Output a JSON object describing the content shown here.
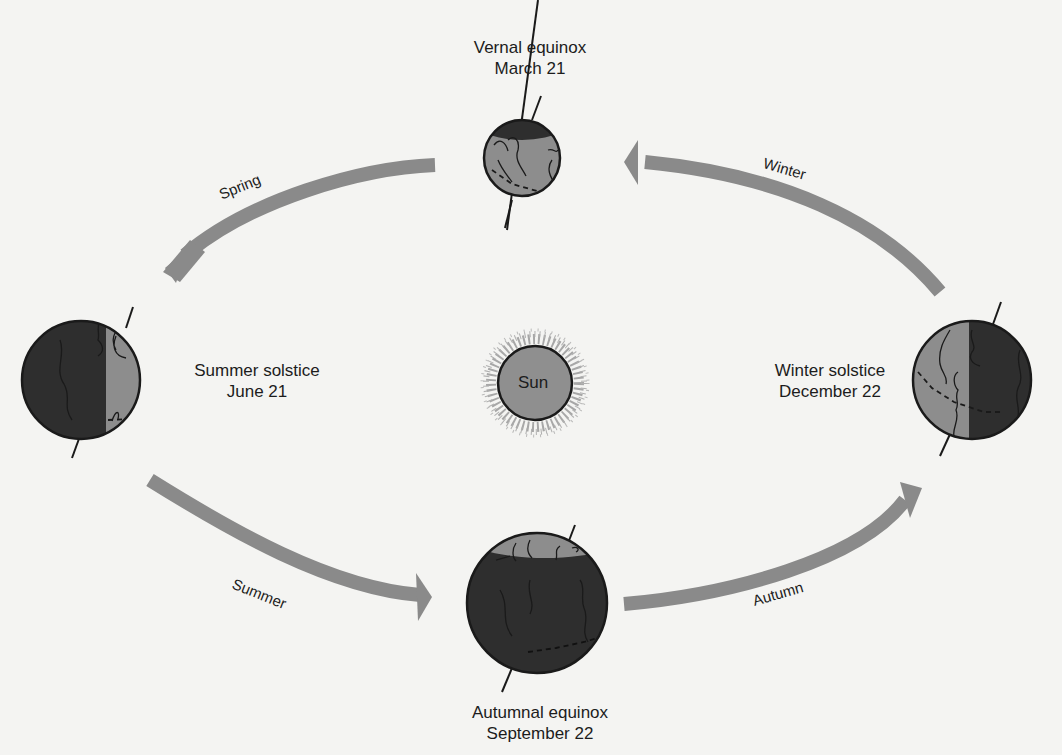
{
  "diagram": {
    "type": "earth-orbit-seasons",
    "sun": {
      "label": "Sun"
    },
    "positions": [
      {
        "id": "vernal",
        "title": "Vernal equinox",
        "date": "March 21"
      },
      {
        "id": "summer",
        "title": "Summer solstice",
        "date": "June 21"
      },
      {
        "id": "autumnal",
        "title": "Autumnal equinox",
        "date": "September 22"
      },
      {
        "id": "winter",
        "title": "Winter solstice",
        "date": "December 22"
      }
    ],
    "seasons": [
      {
        "id": "spring",
        "label": "Spring",
        "from": "vernal",
        "to": "summer"
      },
      {
        "id": "summer",
        "label": "Summer",
        "from": "summer",
        "to": "autumnal"
      },
      {
        "id": "autumn",
        "label": "Autumn",
        "from": "autumnal",
        "to": "winter"
      },
      {
        "id": "winter",
        "label": "Winter",
        "from": "winter",
        "to": "vernal"
      }
    ],
    "colors": {
      "background": "#f4f4f2",
      "arrow": "#8a8a8a",
      "earth_day": "#8d8d8d",
      "earth_night": "#2e2e2e",
      "sun_fill": "#8f8f8f",
      "outline": "#1a1a1a"
    }
  }
}
